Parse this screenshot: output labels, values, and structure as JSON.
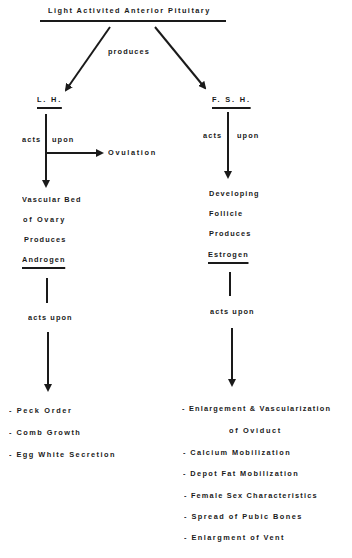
{
  "diagram": {
    "root": {
      "label": "Light Activited Anterior Pituitary"
    },
    "root_relation": "produces",
    "branches": [
      {
        "hormone": "L. H.",
        "relation": {
          "left": "acts",
          "right": "upon"
        },
        "side_effect": "Ovulation",
        "target_lines": [
          "Vascular Bed",
          "of Ovary",
          "Produces"
        ],
        "product": "Androgen",
        "product_relation": "acts upon",
        "effects": [
          "- Peck Order",
          "- Comb Growth",
          "- Egg White Secretion"
        ]
      },
      {
        "hormone": "F. S. H.",
        "relation": {
          "left": "acts",
          "right": "upon"
        },
        "target_lines": [
          "Developing",
          "Follicle",
          "Produces"
        ],
        "product": "Estrogen",
        "product_relation": "acts upon",
        "effects": [
          "- Enlargement & Vascularization",
          "of Oviduct",
          "- Calcium Mobilization",
          "- Depot Fat Mobilization",
          "- Female Sex Characteristics",
          "- Spread of Pubic Bones",
          "- Enlargment of Vent"
        ]
      }
    ]
  },
  "colors": {
    "ink": "#1a1a1a",
    "background": "#ffffff"
  }
}
